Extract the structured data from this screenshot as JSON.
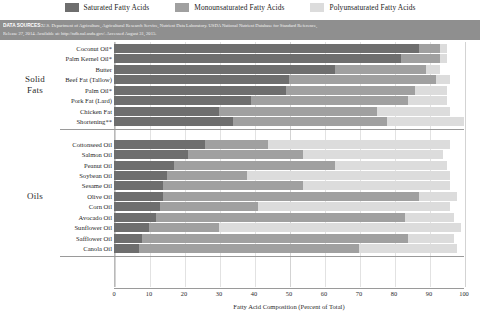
{
  "legend": {
    "items": [
      {
        "label": "Saturated Fatty Acids",
        "color": "#6e6e6e",
        "key": "saturated"
      },
      {
        "label": "Monounsaturated Fatty Acids",
        "color": "#a0a0a0",
        "key": "monounsaturated"
      },
      {
        "label": "Polyunsaturated Fatty Acids",
        "color": "#dcdcdc",
        "key": "polyunsaturated"
      }
    ]
  },
  "source": {
    "tag": "DATA SOURCES:",
    "line1": "U.S. Department of Agriculture, Agricultural Research Service, Nutrient Data Laboratory. USDA National Nutrient Database for Standard Reference,",
    "line2": "Release 27, 2014. Available at: http://ndb.nal.usda.gov/. Accessed August 31, 2015."
  },
  "categories": [
    {
      "name": "Solid Fats",
      "label": "Solid\nFats"
    },
    {
      "name": "Oils",
      "label": "Oils"
    }
  ],
  "axis": {
    "x_title": "Fatty Acid Composition (Percent of Total)",
    "x_ticks": [
      0,
      10,
      20,
      30,
      40,
      50,
      60,
      70,
      80,
      90,
      100
    ]
  },
  "chart_data": {
    "type": "bar",
    "orientation": "horizontal",
    "stacked": true,
    "title": "",
    "xlabel": "Fatty Acid Composition (Percent of Total)",
    "ylabel": "",
    "xlim": [
      0,
      100
    ],
    "grid": true,
    "legend_position": "top",
    "series": [
      {
        "name": "Saturated Fatty Acids",
        "color": "#6e6e6e"
      },
      {
        "name": "Monounsaturated Fatty Acids",
        "color": "#a0a0a0"
      },
      {
        "name": "Polyunsaturated Fatty Acids",
        "color": "#dcdcdc"
      }
    ],
    "groups": [
      {
        "group": "Solid Fats",
        "rows": [
          {
            "label": "Coconut Oil*",
            "saturated": 87,
            "monounsaturated": 6,
            "polyunsaturated": 2
          },
          {
            "label": "Palm Kernel Oil*",
            "saturated": 82,
            "monounsaturated": 11,
            "polyunsaturated": 2
          },
          {
            "label": "Butter",
            "saturated": 63,
            "monounsaturated": 26,
            "polyunsaturated": 4
          },
          {
            "label": "Beef Fat (Tallow)",
            "saturated": 50,
            "monounsaturated": 42,
            "polyunsaturated": 4
          },
          {
            "label": "Palm Oil*",
            "saturated": 49,
            "monounsaturated": 37,
            "polyunsaturated": 9
          },
          {
            "label": "Pork Fat (Lard)",
            "saturated": 39,
            "monounsaturated": 45,
            "polyunsaturated": 11
          },
          {
            "label": "Chicken Fat",
            "saturated": 30,
            "monounsaturated": 45,
            "polyunsaturated": 21
          },
          {
            "label": "Shortening**",
            "saturated": 34,
            "monounsaturated": 44,
            "polyunsaturated": 22
          }
        ]
      },
      {
        "group": "Oils",
        "rows": [
          {
            "label": "Cottonseed Oil",
            "saturated": 26,
            "monounsaturated": 18,
            "polyunsaturated": 52
          },
          {
            "label": "Salmon Oil",
            "saturated": 21,
            "monounsaturated": 33,
            "polyunsaturated": 40
          },
          {
            "label": "Peanut Oil",
            "saturated": 17,
            "monounsaturated": 46,
            "polyunsaturated": 32
          },
          {
            "label": "Soybean Oil",
            "saturated": 15,
            "monounsaturated": 23,
            "polyunsaturated": 58
          },
          {
            "label": "Sesame Oil",
            "saturated": 14,
            "monounsaturated": 40,
            "polyunsaturated": 42
          },
          {
            "label": "Olive Oil",
            "saturated": 14,
            "monounsaturated": 73,
            "polyunsaturated": 11
          },
          {
            "label": "Corn Oil",
            "saturated": 13,
            "monounsaturated": 28,
            "polyunsaturated": 55
          },
          {
            "label": "Avocado Oil",
            "saturated": 12,
            "monounsaturated": 71,
            "polyunsaturated": 14
          },
          {
            "label": "Sunflower Oil",
            "saturated": 10,
            "monounsaturated": 20,
            "polyunsaturated": 69
          },
          {
            "label": "Safflower Oil",
            "saturated": 8,
            "monounsaturated": 76,
            "polyunsaturated": 13
          },
          {
            "label": "Canola Oil",
            "saturated": 7,
            "monounsaturated": 63,
            "polyunsaturated": 28
          }
        ]
      }
    ]
  }
}
